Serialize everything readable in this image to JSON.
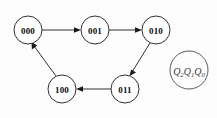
{
  "diagram": {
    "background_color": "#fdfdfd",
    "stroke_color": "#1b1b1b",
    "node_radius": 14,
    "nodes": [
      {
        "id": "s000",
        "label": "000",
        "cx": 28,
        "cy": 30
      },
      {
        "id": "s001",
        "label": "001",
        "cx": 95,
        "cy": 30
      },
      {
        "id": "s010",
        "label": "010",
        "cx": 156,
        "cy": 30
      },
      {
        "id": "s100",
        "label": "100",
        "cx": 62,
        "cy": 89
      },
      {
        "id": "s011",
        "label": "011",
        "cx": 125,
        "cy": 89
      }
    ],
    "edges": [
      {
        "from": "000",
        "to": "001",
        "direction": "right"
      },
      {
        "from": "001",
        "to": "010",
        "direction": "right"
      },
      {
        "from": "010",
        "to": "011",
        "direction": "down-left"
      },
      {
        "from": "011",
        "to": "100",
        "direction": "left"
      },
      {
        "from": "100",
        "to": "000",
        "direction": "up-right"
      }
    ],
    "legend": {
      "name": "state-variable-legend",
      "cx": 189,
      "cy": 70,
      "r": 19,
      "stroke_color": "#4a4a4a",
      "variables": [
        {
          "base": "Q",
          "subscript": "2"
        },
        {
          "base": "Q",
          "subscript": "1"
        },
        {
          "base": "Q",
          "subscript": "0"
        }
      ],
      "text": "Q2Q1Q0"
    }
  }
}
